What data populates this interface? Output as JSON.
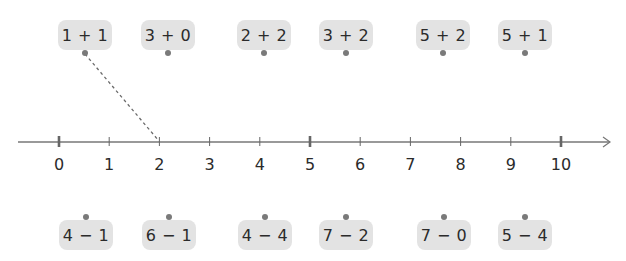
{
  "colors": {
    "card_bg": "#e3e3e3",
    "dot": "#7a7a7a",
    "axis": "#666666",
    "text": "#2b2b2b"
  },
  "number_line": {
    "min": 0,
    "max": 10,
    "tick_labels": [
      "0",
      "1",
      "2",
      "3",
      "4",
      "5",
      "6",
      "7",
      "8",
      "9",
      "10"
    ],
    "major_ticks": [
      0,
      5,
      10
    ],
    "arrow": "right"
  },
  "top_cards": [
    {
      "expr": "1 + 1",
      "value": 2,
      "x": 85
    },
    {
      "expr": "3 + 0",
      "value": 3,
      "x": 168
    },
    {
      "expr": "2 + 2",
      "value": 4,
      "x": 264
    },
    {
      "expr": "3 + 2",
      "value": 5,
      "x": 346
    },
    {
      "expr": "5 + 2",
      "value": 7,
      "x": 443
    },
    {
      "expr": "5 + 1",
      "value": 6,
      "x": 525
    }
  ],
  "bottom_cards": [
    {
      "expr": "4 − 1",
      "value": 3,
      "x": 86
    },
    {
      "expr": "6 − 1",
      "value": 5,
      "x": 169
    },
    {
      "expr": "4 − 4",
      "value": 0,
      "x": 265
    },
    {
      "expr": "7 − 2",
      "value": 5,
      "x": 346
    },
    {
      "expr": "7 − 0",
      "value": 7,
      "x": 444
    },
    {
      "expr": "5 − 4",
      "value": 1,
      "x": 525
    }
  ],
  "example_connection": {
    "from_card": "1 + 1",
    "to_tick": "2",
    "style": "dashed"
  }
}
